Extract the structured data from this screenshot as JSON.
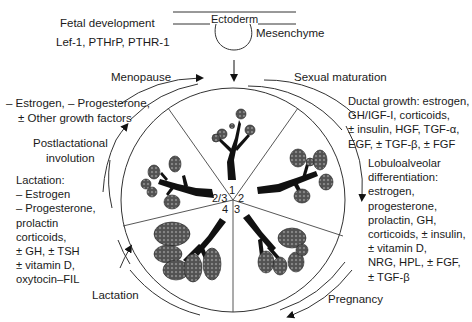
{
  "top": {
    "fetal_title": "Fetal development",
    "fetal_factors": "Lef-1, PTHrP, PTHR-1",
    "ectoderm": "Ectoderm",
    "mesenchyme": "Mesenchyme"
  },
  "stages": {
    "menopause": "Menopause",
    "sexual_maturation": "Sexual maturation",
    "pregnancy": "Pregnancy",
    "lactation": "Lactation",
    "postlactational_line1": "Postlactational",
    "postlactational_line2": "involution"
  },
  "menopause_factors": {
    "line1": "– Estrogen, – Progesterone,",
    "line2": "± Other growth factors"
  },
  "lactation_factors": {
    "lines": [
      "Lactation:",
      "– Estrogen",
      "– Progesterone,",
      "prolactin",
      "corticoids,",
      "± GH, ± TSH",
      "± vitamin D,",
      "oxytocin–FIL"
    ]
  },
  "ductal_growth": {
    "lines": [
      "Ductal growth: estrogen,",
      "GH/IGF-I, corticoids,",
      "± insulin, HGF, TGF-α,",
      "EGF, ± TGF-β, ± FGF"
    ]
  },
  "lobuloalveolar": {
    "lines": [
      "Lobuloalveolar",
      "differentiation:",
      "estrogen,",
      "progesterone,",
      "prolactin, GH,",
      "corticoids, ± insulin,",
      "± vitamin D,",
      "NRG, HPL, ± FGF,",
      "± TGF-β"
    ]
  },
  "center_numbers": {
    "n1": "1",
    "n2": "2",
    "n3": "3",
    "n4": "4",
    "n23": "2/3"
  }
}
